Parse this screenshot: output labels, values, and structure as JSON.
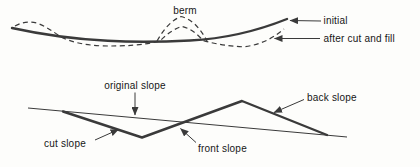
{
  "profile_diagram": {
    "labels": {
      "berm": "berm",
      "initial": "initial",
      "after_cut_and_fill": "after cut and fill"
    }
  },
  "slope_diagram": {
    "labels": {
      "original_slope": "original slope",
      "cut_slope": "cut slope",
      "front_slope": "front slope",
      "back_slope": "back slope"
    }
  },
  "colors": {
    "ink": "#3a3a3a",
    "text": "#161616",
    "background": "#fdfdfb"
  }
}
